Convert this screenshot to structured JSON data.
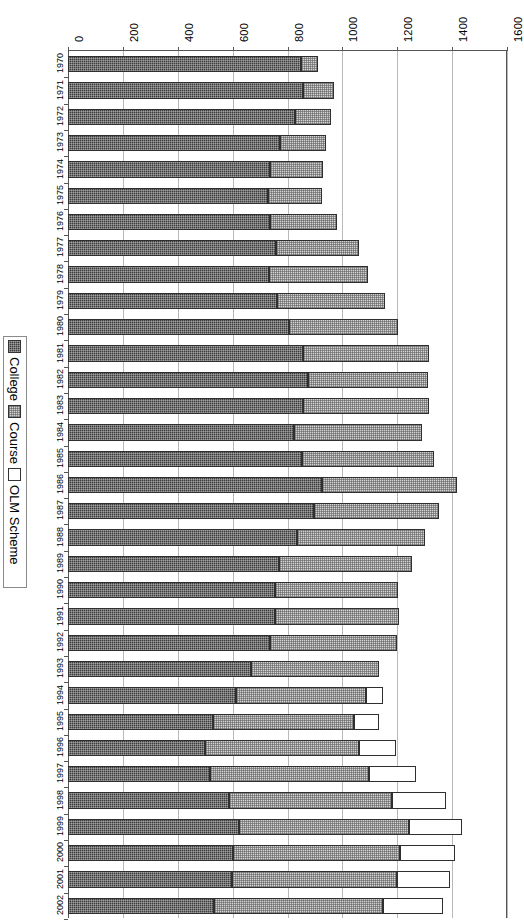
{
  "chart_data": {
    "type": "bar",
    "orientation": "horizontal-rotated",
    "stacked": true,
    "title": "",
    "xlabel": "",
    "ylabel": "",
    "xlim": [
      0,
      1600
    ],
    "grid": true,
    "legend_position": "left",
    "axis_ticks": [
      "0",
      "200",
      "400",
      "600",
      "800",
      "1000",
      "1200",
      "1400",
      "1600"
    ],
    "tick_values": [
      0,
      200,
      400,
      600,
      800,
      1000,
      1200,
      1400,
      1600
    ],
    "categories": [
      "1970",
      "1971",
      "1972",
      "1973",
      "1974",
      "1975",
      "1976",
      "1977",
      "1978",
      "1979",
      "1980",
      "1981",
      "1982",
      "1983",
      "1984",
      "1985",
      "1986",
      "1987",
      "1988",
      "1989",
      "1990",
      "1991",
      "1992",
      "1993",
      "1994",
      "1995",
      "1996",
      "1997",
      "1998",
      "1999",
      "2000",
      "2001",
      "2002"
    ],
    "series": [
      {
        "name": "College",
        "color": "#3b3b3b",
        "values": [
          848,
          857,
          826,
          771,
          738,
          730,
          738,
          759,
          734,
          762,
          804,
          857,
          873,
          855,
          823,
          854,
          927,
          897,
          833,
          768,
          754,
          754,
          738,
          667,
          612,
          530,
          498,
          518,
          588,
          622,
          603,
          597,
          531
        ]
      },
      {
        "name": "Course",
        "color": "#d2d2d2",
        "values": [
          63,
          113,
          132,
          171,
          192,
          196,
          243,
          303,
          361,
          394,
          399,
          459,
          440,
          461,
          468,
          480,
          489,
          456,
          469,
          484,
          449,
          451,
          461,
          465,
          474,
          514,
          562,
          579,
          592,
          620,
          606,
          602,
          617
        ]
      },
      {
        "name": "OLM Scheme",
        "color": "#ffffff",
        "values": [
          0,
          0,
          0,
          0,
          0,
          0,
          0,
          0,
          0,
          0,
          0,
          0,
          0,
          0,
          0,
          0,
          0,
          0,
          0,
          0,
          0,
          0,
          0,
          0,
          61,
          88,
          136,
          173,
          198,
          195,
          201,
          193,
          219
        ]
      }
    ],
    "totals": [
      911,
      970,
      958,
      942,
      930,
      926,
      981,
      1062,
      1095,
      1156,
      1203,
      1316,
      1313,
      1316,
      1291,
      1334,
      1416,
      1353,
      1302,
      1252,
      1203,
      1205,
      1199,
      1132,
      1147,
      1132,
      1196,
      1270,
      1378,
      1437,
      1410,
      1392,
      1367
    ]
  },
  "legend": {
    "items": [
      {
        "label": "College",
        "swatch": "college-swatch"
      },
      {
        "label": "Course",
        "swatch": "course-swatch"
      },
      {
        "label": "OLM Scheme",
        "swatch": "olm-swatch"
      }
    ]
  }
}
